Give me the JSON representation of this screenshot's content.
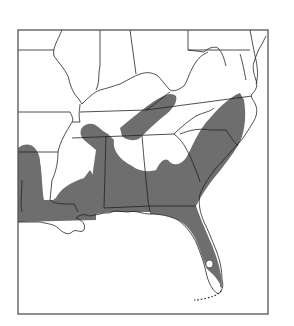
{
  "map": {
    "title": "",
    "region": "Southeastern United States",
    "type": "species range distribution map",
    "colors": {
      "range_fill": "#6e6e6e",
      "background": "#ffffff",
      "border": "#222222",
      "frame": "#555555"
    },
    "legend": [],
    "features": [
      "state boundaries",
      "shaded range area",
      "Gulf coastline",
      "Atlantic coastline",
      "Florida Keys (dotted)"
    ]
  }
}
